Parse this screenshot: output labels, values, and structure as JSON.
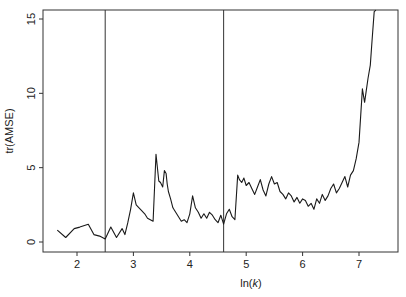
{
  "chart_data": {
    "type": "line",
    "title": "",
    "xlabel": "ln(k)",
    "xlabel_prefix": "ln(",
    "xlabel_var": "k",
    "xlabel_suffix": ")",
    "ylabel": "tr(AMSE)",
    "xlim": [
      1.4,
      7.7
    ],
    "ylim": [
      -0.6,
      15.6
    ],
    "xticks": [
      2,
      3,
      4,
      5,
      6,
      7
    ],
    "yticks": [
      0,
      5,
      10,
      15
    ],
    "grid": false,
    "legend": null,
    "vertical_lines": [
      2.5,
      4.6
    ],
    "series": [
      {
        "name": "tr(AMSE)",
        "color": "#1a1a1a",
        "x": [
          1.65,
          1.8,
          1.95,
          2.05,
          2.2,
          2.3,
          2.4,
          2.5,
          2.6,
          2.7,
          2.8,
          2.85,
          2.9,
          2.95,
          3.0,
          3.05,
          3.1,
          3.15,
          3.2,
          3.25,
          3.3,
          3.35,
          3.4,
          3.42,
          3.45,
          3.48,
          3.52,
          3.55,
          3.58,
          3.6,
          3.62,
          3.66,
          3.7,
          3.75,
          3.8,
          3.85,
          3.9,
          3.95,
          4.0,
          4.05,
          4.1,
          4.15,
          4.2,
          4.25,
          4.3,
          4.35,
          4.4,
          4.45,
          4.5,
          4.55,
          4.6,
          4.65,
          4.7,
          4.75,
          4.8,
          4.85,
          4.88,
          4.92,
          4.96,
          5.0,
          5.05,
          5.1,
          5.15,
          5.2,
          5.25,
          5.3,
          5.35,
          5.4,
          5.45,
          5.5,
          5.55,
          5.6,
          5.65,
          5.7,
          5.75,
          5.8,
          5.85,
          5.9,
          5.95,
          6.0,
          6.05,
          6.1,
          6.15,
          6.2,
          6.25,
          6.3,
          6.35,
          6.4,
          6.45,
          6.5,
          6.55,
          6.6,
          6.65,
          6.7,
          6.75,
          6.8,
          6.85,
          6.9,
          6.95,
          7.0,
          7.03,
          7.06,
          7.1,
          7.13,
          7.16,
          7.2,
          7.23,
          7.27,
          7.3
        ],
        "values": [
          0.8,
          0.3,
          0.9,
          1.0,
          1.2,
          0.5,
          0.4,
          0.2,
          1.0,
          0.3,
          0.9,
          0.5,
          1.3,
          2.2,
          3.3,
          2.5,
          2.3,
          2.1,
          1.9,
          1.6,
          1.5,
          1.4,
          5.9,
          5.2,
          4.1,
          4.0,
          3.7,
          4.8,
          4.6,
          3.9,
          3.4,
          2.9,
          2.3,
          2.0,
          1.7,
          1.4,
          1.5,
          1.3,
          1.9,
          3.1,
          2.3,
          2.0,
          1.6,
          1.9,
          1.6,
          2.0,
          1.8,
          1.5,
          1.3,
          1.8,
          1.2,
          1.9,
          2.2,
          1.7,
          1.5,
          4.5,
          4.2,
          4.0,
          4.3,
          3.8,
          4.0,
          3.6,
          3.2,
          3.7,
          4.2,
          3.5,
          3.1,
          3.9,
          4.4,
          3.9,
          4.0,
          3.4,
          3.2,
          2.9,
          3.3,
          3.1,
          2.7,
          3.0,
          2.6,
          2.9,
          2.8,
          2.4,
          2.6,
          2.2,
          2.9,
          2.6,
          3.2,
          2.8,
          3.1,
          3.6,
          3.9,
          3.3,
          3.6,
          4.0,
          4.4,
          3.7,
          4.5,
          4.8,
          5.6,
          6.7,
          8.5,
          10.3,
          9.4,
          10.2,
          11.0,
          11.9,
          13.5,
          15.5,
          15.6
        ]
      }
    ]
  }
}
